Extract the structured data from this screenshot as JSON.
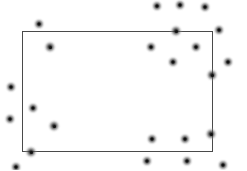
{
  "figure": {
    "width": 247,
    "height": 170,
    "background_color": "#ffffff",
    "title": "",
    "point_count": 28
  },
  "region": {
    "label": "rectangle-region",
    "x": 22,
    "y": 31,
    "width": 191,
    "height": 121,
    "stroke_color": "#4a4a4a",
    "stroke_width": 1,
    "fill": "none"
  },
  "chart_data": {
    "type": "scatter",
    "title": "",
    "xlabel": "",
    "ylabel": "",
    "xlim": [
      0,
      247
    ],
    "ylim": [
      0,
      170
    ],
    "grid": false,
    "legend": "none",
    "marker": {
      "shape": "circle",
      "style": "blurred-gaussian-dot",
      "diameter": 13,
      "color": "#333333"
    },
    "annotations": [
      {
        "type": "rectangle",
        "x": 22,
        "y": 31,
        "width": 191,
        "height": 121,
        "stroke_color": "#4a4a4a"
      }
    ],
    "series": [
      {
        "name": "points",
        "points": [
          {
            "x": 39,
            "y": 24,
            "size": 13
          },
          {
            "x": 157,
            "y": 6,
            "size": 13
          },
          {
            "x": 180,
            "y": 5,
            "size": 13
          },
          {
            "x": 205,
            "y": 7,
            "size": 13
          },
          {
            "x": 176,
            "y": 31,
            "size": 14
          },
          {
            "x": 219,
            "y": 30,
            "size": 13
          },
          {
            "x": 50,
            "y": 47,
            "size": 14
          },
          {
            "x": 151,
            "y": 47,
            "size": 13
          },
          {
            "x": 196,
            "y": 47,
            "size": 13
          },
          {
            "x": 173,
            "y": 62,
            "size": 13
          },
          {
            "x": 228,
            "y": 62,
            "size": 13
          },
          {
            "x": 212,
            "y": 75,
            "size": 14
          },
          {
            "x": 11,
            "y": 87,
            "size": 13
          },
          {
            "x": 33,
            "y": 108,
            "size": 13
          },
          {
            "x": 10,
            "y": 119,
            "size": 13
          },
          {
            "x": 54,
            "y": 126,
            "size": 14
          },
          {
            "x": 31,
            "y": 152,
            "size": 14
          },
          {
            "x": 16,
            "y": 167,
            "size": 13
          },
          {
            "x": 152,
            "y": 139,
            "size": 13
          },
          {
            "x": 185,
            "y": 139,
            "size": 13
          },
          {
            "x": 211,
            "y": 134,
            "size": 14
          },
          {
            "x": 147,
            "y": 161,
            "size": 13
          },
          {
            "x": 187,
            "y": 161,
            "size": 13
          },
          {
            "x": 223,
            "y": 165,
            "size": 13
          }
        ]
      }
    ]
  }
}
